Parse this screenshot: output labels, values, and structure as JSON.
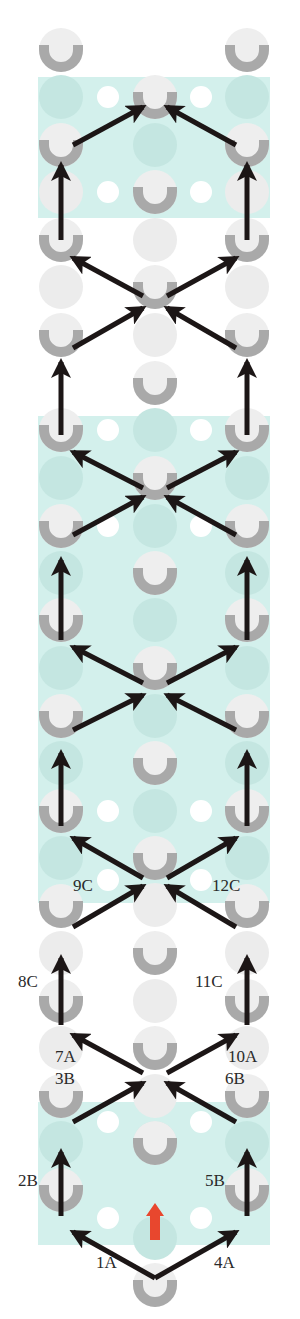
{
  "diagram": {
    "title": "",
    "colors": {
      "background": "#ffffff",
      "band": "#d3f0ec",
      "band_dot": "#c4e6e1",
      "peg_ring": "#a9a9a9",
      "peg_fill": "#eeeeee",
      "ghost": "#ececec",
      "white_dot": "#ffffff",
      "arrow": "#1c1616",
      "start_arrow": "#e8472e",
      "label": "#2a2a2a"
    },
    "bands": [
      {
        "y": 77,
        "height": 141
      },
      {
        "y": 416,
        "height": 487
      },
      {
        "y": 1102,
        "height": 143
      }
    ],
    "columns": {
      "left": 61,
      "left_mid": 108,
      "center": 155,
      "right_mid": 201,
      "right": 247
    },
    "u_pegs": [
      {
        "x": 61,
        "y": 50
      },
      {
        "x": 247,
        "y": 50
      },
      {
        "x": 155,
        "y": 97
      },
      {
        "x": 61,
        "y": 145
      },
      {
        "x": 247,
        "y": 145
      },
      {
        "x": 155,
        "y": 192
      },
      {
        "x": 61,
        "y": 240
      },
      {
        "x": 247,
        "y": 240
      },
      {
        "x": 155,
        "y": 287
      },
      {
        "x": 61,
        "y": 335
      },
      {
        "x": 247,
        "y": 335
      },
      {
        "x": 155,
        "y": 383
      },
      {
        "x": 61,
        "y": 430
      },
      {
        "x": 247,
        "y": 430
      },
      {
        "x": 155,
        "y": 478
      },
      {
        "x": 61,
        "y": 526
      },
      {
        "x": 247,
        "y": 526
      },
      {
        "x": 155,
        "y": 573
      },
      {
        "x": 61,
        "y": 620
      },
      {
        "x": 247,
        "y": 620
      },
      {
        "x": 155,
        "y": 668
      },
      {
        "x": 61,
        "y": 716
      },
      {
        "x": 247,
        "y": 716
      },
      {
        "x": 155,
        "y": 763
      },
      {
        "x": 61,
        "y": 811
      },
      {
        "x": 247,
        "y": 811
      },
      {
        "x": 155,
        "y": 858
      },
      {
        "x": 61,
        "y": 906
      },
      {
        "x": 247,
        "y": 906
      },
      {
        "x": 155,
        "y": 953
      },
      {
        "x": 61,
        "y": 1001
      },
      {
        "x": 247,
        "y": 1001
      },
      {
        "x": 155,
        "y": 1048
      },
      {
        "x": 61,
        "y": 1096
      },
      {
        "x": 247,
        "y": 1096
      },
      {
        "x": 155,
        "y": 1143
      },
      {
        "x": 61,
        "y": 1190
      },
      {
        "x": 247,
        "y": 1190
      },
      {
        "x": 155,
        "y": 1285
      }
    ],
    "ghost_circles": [
      {
        "x": 155,
        "y": 240
      },
      {
        "x": 61,
        "y": 287
      },
      {
        "x": 247,
        "y": 287
      },
      {
        "x": 155,
        "y": 335
      },
      {
        "x": 61,
        "y": 192
      },
      {
        "x": 247,
        "y": 192
      },
      {
        "x": 155,
        "y": 905
      },
      {
        "x": 155,
        "y": 1001
      },
      {
        "x": 61,
        "y": 953
      },
      {
        "x": 247,
        "y": 953
      },
      {
        "x": 61,
        "y": 1048
      },
      {
        "x": 247,
        "y": 1048
      },
      {
        "x": 155,
        "y": 1096
      }
    ],
    "band_circles": [
      {
        "x": 61,
        "y": 97
      },
      {
        "x": 247,
        "y": 97
      },
      {
        "x": 155,
        "y": 145
      },
      {
        "x": 155,
        "y": 430
      },
      {
        "x": 61,
        "y": 478
      },
      {
        "x": 247,
        "y": 478
      },
      {
        "x": 155,
        "y": 526
      },
      {
        "x": 61,
        "y": 573
      },
      {
        "x": 247,
        "y": 573
      },
      {
        "x": 155,
        "y": 620
      },
      {
        "x": 61,
        "y": 668
      },
      {
        "x": 247,
        "y": 668
      },
      {
        "x": 155,
        "y": 716
      },
      {
        "x": 61,
        "y": 763
      },
      {
        "x": 247,
        "y": 763
      },
      {
        "x": 155,
        "y": 811
      },
      {
        "x": 61,
        "y": 858
      },
      {
        "x": 247,
        "y": 858
      },
      {
        "x": 155,
        "y": 1143
      },
      {
        "x": 61,
        "y": 1143
      },
      {
        "x": 247,
        "y": 1143
      },
      {
        "x": 155,
        "y": 1238
      }
    ],
    "white_dots": [
      {
        "x": 108,
        "y": 97
      },
      {
        "x": 201,
        "y": 97
      },
      {
        "x": 108,
        "y": 192
      },
      {
        "x": 201,
        "y": 192
      },
      {
        "x": 108,
        "y": 430
      },
      {
        "x": 201,
        "y": 430
      },
      {
        "x": 108,
        "y": 526
      },
      {
        "x": 201,
        "y": 526
      },
      {
        "x": 108,
        "y": 811
      },
      {
        "x": 201,
        "y": 811
      },
      {
        "x": 108,
        "y": 880
      },
      {
        "x": 201,
        "y": 880
      },
      {
        "x": 108,
        "y": 1122
      },
      {
        "x": 201,
        "y": 1122
      },
      {
        "x": 108,
        "y": 1218
      },
      {
        "x": 201,
        "y": 1218
      }
    ],
    "arrows": [
      {
        "from": [
          155,
          1278
        ],
        "to": [
          73,
          1232
        ]
      },
      {
        "from": [
          155,
          1278
        ],
        "to": [
          236,
          1232
        ]
      },
      {
        "from": [
          61,
          1216
        ],
        "to": [
          61,
          1152
        ]
      },
      {
        "from": [
          247,
          1216
        ],
        "to": [
          247,
          1152
        ]
      },
      {
        "from": [
          73,
          1122
        ],
        "to": [
          143,
          1083
        ]
      },
      {
        "from": [
          236,
          1122
        ],
        "to": [
          167,
          1083
        ]
      },
      {
        "from": [
          143,
          1073
        ],
        "to": [
          73,
          1035
        ]
      },
      {
        "from": [
          167,
          1073
        ],
        "to": [
          236,
          1035
        ]
      },
      {
        "from": [
          61,
          1025
        ],
        "to": [
          61,
          958
        ]
      },
      {
        "from": [
          247,
          1025
        ],
        "to": [
          247,
          958
        ]
      },
      {
        "from": [
          73,
          927
        ],
        "to": [
          143,
          886
        ]
      },
      {
        "from": [
          236,
          927
        ],
        "to": [
          167,
          886
        ]
      },
      {
        "from": [
          143,
          878
        ],
        "to": [
          73,
          838
        ]
      },
      {
        "from": [
          167,
          878
        ],
        "to": [
          236,
          838
        ]
      },
      {
        "from": [
          61,
          826
        ],
        "to": [
          61,
          753
        ]
      },
      {
        "from": [
          247,
          826
        ],
        "to": [
          247,
          753
        ]
      },
      {
        "from": [
          73,
          730
        ],
        "to": [
          143,
          695
        ]
      },
      {
        "from": [
          236,
          730
        ],
        "to": [
          167,
          695
        ]
      },
      {
        "from": [
          143,
          683
        ],
        "to": [
          73,
          647
        ]
      },
      {
        "from": [
          167,
          683
        ],
        "to": [
          236,
          647
        ]
      },
      {
        "from": [
          61,
          640
        ],
        "to": [
          61,
          560
        ]
      },
      {
        "from": [
          247,
          640
        ],
        "to": [
          247,
          560
        ]
      },
      {
        "from": [
          73,
          535
        ],
        "to": [
          143,
          497
        ]
      },
      {
        "from": [
          236,
          535
        ],
        "to": [
          167,
          497
        ]
      },
      {
        "from": [
          143,
          488
        ],
        "to": [
          73,
          452
        ]
      },
      {
        "from": [
          167,
          488
        ],
        "to": [
          236,
          452
        ]
      },
      {
        "from": [
          61,
          435
        ],
        "to": [
          61,
          362
        ]
      },
      {
        "from": [
          247,
          435
        ],
        "to": [
          247,
          362
        ]
      },
      {
        "from": [
          73,
          348
        ],
        "to": [
          143,
          308
        ]
      },
      {
        "from": [
          236,
          348
        ],
        "to": [
          167,
          308
        ]
      },
      {
        "from": [
          143,
          296
        ],
        "to": [
          73,
          258
        ]
      },
      {
        "from": [
          167,
          296
        ],
        "to": [
          236,
          258
        ]
      },
      {
        "from": [
          61,
          240
        ],
        "to": [
          61,
          165
        ]
      },
      {
        "from": [
          247,
          240
        ],
        "to": [
          247,
          165
        ]
      },
      {
        "from": [
          73,
          145
        ],
        "to": [
          143,
          107
        ]
      },
      {
        "from": [
          236,
          145
        ],
        "to": [
          167,
          107
        ]
      }
    ],
    "start_marker": {
      "x": 155,
      "y_top": 1203,
      "y_bottom": 1240
    },
    "labels": [
      {
        "text": "1A",
        "x": 96,
        "y": 1263
      },
      {
        "text": "4A",
        "x": 214,
        "y": 1263
      },
      {
        "text": "2B",
        "x": 18,
        "y": 1181
      },
      {
        "text": "5B",
        "x": 205,
        "y": 1181
      },
      {
        "text": "3B",
        "x": 55,
        "y": 1079
      },
      {
        "text": "6B",
        "x": 225,
        "y": 1079
      },
      {
        "text": "7A",
        "x": 55,
        "y": 1057
      },
      {
        "text": "10A",
        "x": 228,
        "y": 1057
      },
      {
        "text": "8C",
        "x": 18,
        "y": 982
      },
      {
        "text": "11C",
        "x": 195,
        "y": 982
      },
      {
        "text": "9C",
        "x": 73,
        "y": 886
      },
      {
        "text": "12C",
        "x": 212,
        "y": 886
      }
    ]
  }
}
